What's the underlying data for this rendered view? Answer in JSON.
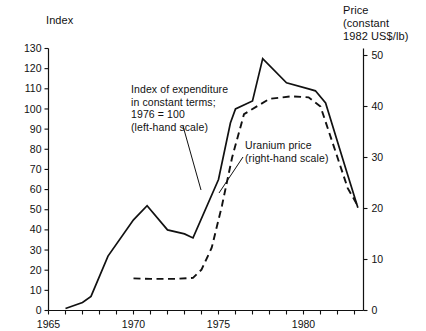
{
  "axes": {
    "left_title": "Index",
    "right_title": "Price\n(constant\n1982 US$/lb)",
    "left_ticks": [
      "0",
      "10",
      "20",
      "30",
      "40",
      "50",
      "60",
      "70",
      "80",
      "90",
      "100",
      "110",
      "120",
      "130"
    ],
    "right_ticks": [
      "0",
      "10",
      "20",
      "30",
      "40",
      "50"
    ],
    "x_ticks": [
      "1965",
      "1970",
      "1975",
      "1980"
    ]
  },
  "annotations": {
    "index_note": "Index of expenditure\nin constant terms;\n1976 = 100\n(left-hand scale)",
    "price_note": "Uranium price\n(right-hand scale)"
  },
  "colors": {
    "ink": "#111111",
    "background": "#ffffff"
  },
  "chart_data": {
    "type": "line",
    "title": "",
    "xlabel": "",
    "ylabel": "Index",
    "y2label": "Price (constant 1982 US$/lb)",
    "xlim": [
      1965,
      1983.5
    ],
    "ylim": [
      0,
      130
    ],
    "y2lim": [
      0,
      50
    ],
    "grid": false,
    "legend": "annotations",
    "series": [
      {
        "name": "Index of expenditure in constant terms; 1976 = 100 (left-hand scale)",
        "axis": "left",
        "style": "solid",
        "x": [
          1966.0,
          1967.0,
          1967.5,
          1968.5,
          1970.0,
          1970.8,
          1972.0,
          1973.0,
          1973.5,
          1975.0,
          1975.7,
          1976.0,
          1977.0,
          1977.6,
          1979.0,
          1980.3,
          1980.7,
          1981.3,
          1982.5,
          1983.2
        ],
        "y": [
          1,
          4,
          7,
          27,
          45,
          52,
          40,
          38,
          36,
          65,
          93,
          100,
          104,
          125,
          113,
          110,
          109,
          103,
          70,
          51
        ]
      },
      {
        "name": "Uranium price (right-hand scale)",
        "axis": "right",
        "style": "dashed",
        "x": [
          1970.0,
          1971.0,
          1972.5,
          1973.5,
          1974.0,
          1974.6,
          1975.2,
          1975.8,
          1976.5,
          1978.0,
          1979.3,
          1980.3,
          1981.0,
          1981.7,
          1982.6,
          1983.2
        ],
        "y": [
          6.3,
          6.2,
          6.2,
          6.4,
          8.0,
          12.3,
          20.5,
          30.0,
          38.5,
          41.5,
          42.0,
          41.8,
          40.0,
          33.0,
          24.0,
          20.5
        ]
      }
    ]
  }
}
